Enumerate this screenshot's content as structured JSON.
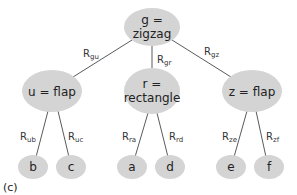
{
  "diagram": {
    "type": "tree",
    "caption": "(c)",
    "node_color": "#d4d4d4",
    "edge_color": "#5a5a5a",
    "nodes": {
      "root": {
        "line1": "g =",
        "line2": "zigzag"
      },
      "u": {
        "label": "u = flap"
      },
      "r": {
        "line1": "r =",
        "line2": "rectangle"
      },
      "z": {
        "label": "z = flap"
      },
      "b": {
        "label": "b"
      },
      "c": {
        "label": "c"
      },
      "a": {
        "label": "a"
      },
      "d": {
        "label": "d"
      },
      "e": {
        "label": "e"
      },
      "f": {
        "label": "f"
      }
    },
    "edges": {
      "gu": {
        "main": "R",
        "sub": "gu"
      },
      "gr": {
        "main": "R",
        "sub": "gr"
      },
      "gz": {
        "main": "R",
        "sub": "gz"
      },
      "ub": {
        "main": "R",
        "sub": "ub"
      },
      "uc": {
        "main": "R",
        "sub": "uc"
      },
      "ra": {
        "main": "R",
        "sub": "ra"
      },
      "rd": {
        "main": "R",
        "sub": "rd"
      },
      "ze": {
        "main": "R",
        "sub": "ze"
      },
      "zf": {
        "main": "R",
        "sub": "zf"
      }
    }
  }
}
